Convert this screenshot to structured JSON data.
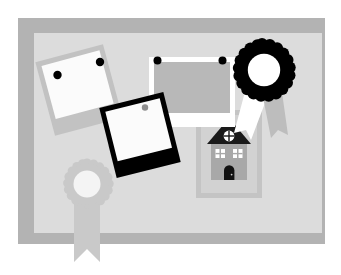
{
  "canvas": {
    "width": 341,
    "height": 275,
    "background": "#ffffff",
    "title": "Memory board with photos, award rosettes and a house"
  },
  "palette": {
    "background": "#ffffff",
    "frame_border": "#b3b3b3",
    "board_surface": "#d9d9d9",
    "photo_gray_frame": "#c2c2c2",
    "photo_black_frame": "#000000",
    "photo_white_frame": "#ffffff",
    "photo_image_light": "#fafafa",
    "photo_image_mid": "#b8b8b8",
    "pin_dark": "#000000",
    "pin_gray": "#8f8f8f",
    "rosette_dark": "#000000",
    "rosette_gray": "#c9c9c9",
    "rosette_center_white": "#ffffff",
    "ribbon_white": "#ffffff",
    "ribbon_gray": "#bdbdbd",
    "house_roof": "#1a1a1a",
    "house_body": "#a8a8a8",
    "house_window": "#ffffff",
    "house_door": "#111111",
    "house_mat": "#c4c4c4",
    "house_mat_inner": "#cfcfcf"
  },
  "frame": {
    "name": "picture-frame",
    "x": 18,
    "y": 18,
    "width": 307,
    "height": 226,
    "border_color": "#b3b3b3",
    "inner": {
      "x": 34,
      "y": 33,
      "width": 288,
      "height": 200,
      "color": "#d9d9d9"
    }
  },
  "objects": [
    {
      "id": "photo-gray",
      "label": "Polaroid photo with gray frame",
      "type": "photo",
      "frame_color": "#c2c2c2",
      "image_color": "#fafafa",
      "rotation_deg": -15,
      "center_x": 79,
      "center_y": 90,
      "width": 70,
      "height": 76,
      "pins": 2,
      "pin_color": "#000000"
    },
    {
      "id": "photo-white",
      "label": "Polaroid photo with white frame",
      "type": "photo",
      "frame_color": "#ffffff",
      "image_color": "#b8b8b8",
      "rotation_deg": 0,
      "center_x": 192,
      "center_y": 92,
      "width": 86,
      "height": 70,
      "pins": 2,
      "pin_color": "#000000"
    },
    {
      "id": "photo-black",
      "label": "Polaroid photo with black frame",
      "type": "photo",
      "frame_color": "#000000",
      "image_color": "#fafafa",
      "rotation_deg": -14,
      "center_x": 140,
      "center_y": 135,
      "width": 66,
      "height": 72,
      "pins": 1,
      "pin_color": "#8f8f8f"
    },
    {
      "id": "rosette-black",
      "label": "Black award rosette with two ribbon tails",
      "type": "rosette",
      "center_x": 262,
      "center_y": 72,
      "outer_radius": 28,
      "inner_radius": 15,
      "scallops": 22,
      "body_color": "#000000",
      "center_color": "#ffffff",
      "ribbons": [
        {
          "color": "#ffffff",
          "side": "left"
        },
        {
          "color": "#bdbdbd",
          "side": "right"
        }
      ]
    },
    {
      "id": "rosette-gray",
      "label": "Gray award rosette with single ribbon tail",
      "type": "rosette",
      "center_x": 87,
      "center_y": 184,
      "outer_radius": 21,
      "inner_radius": 13,
      "scallops": 20,
      "body_color": "#c9c9c9",
      "center_color": "#f2f2f2",
      "ribbons": [
        {
          "color": "#c9c9c9",
          "side": "center"
        }
      ]
    },
    {
      "id": "house-picture",
      "label": "Framed picture of a house",
      "type": "house",
      "mat_x": 196,
      "mat_y": 110,
      "mat_width": 66,
      "mat_height": 88,
      "roof_color": "#1a1a1a",
      "body_color": "#a8a8a8",
      "door_color": "#111111",
      "window_color": "#ffffff",
      "windows": 2,
      "attic_window": "round",
      "door": "arched"
    }
  ],
  "icon_names": [
    "photo-icon",
    "award-rosette-icon",
    "house-icon",
    "pushpin-icon",
    "picture-frame-icon"
  ]
}
